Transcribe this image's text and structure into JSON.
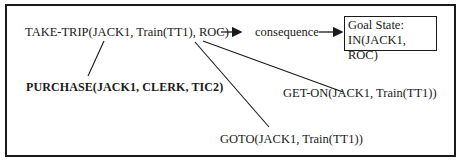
{
  "diagram": {
    "nodes": {
      "take_trip": "TAKE-TRIP(JACK1, Train(TT1), ROC)",
      "consequence": "consequence",
      "goal_state_title": "Goal State:",
      "goal_state_value": "IN(JACK1, ROC)",
      "purchase": "PURCHASE(JACK1, CLERK, TIC2)",
      "get_on": "GET-ON(JACK1, Train(TT1))",
      "goto": "GOTO(JACK1, Train(TT1))"
    },
    "edges": [
      {
        "from": "take_trip",
        "to": "consequence",
        "type": "arrow"
      },
      {
        "from": "consequence",
        "to": "goal_state",
        "type": "arrow"
      },
      {
        "from": "take_trip",
        "to": "purchase",
        "type": "line"
      },
      {
        "from": "take_trip",
        "to": "get_on",
        "type": "line"
      },
      {
        "from": "take_trip",
        "to": "goto",
        "type": "line"
      }
    ],
    "colors": {
      "ink": "#1a1a1a",
      "background": "#ffffff"
    }
  }
}
